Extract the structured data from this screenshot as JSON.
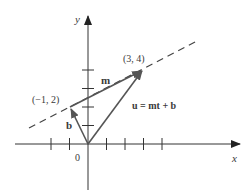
{
  "diagram": {
    "axes": {
      "x_label": "x",
      "y_label": "y",
      "origin_label": "0",
      "x_ticks": [
        -2,
        -1,
        1,
        2,
        3,
        4
      ],
      "y_ticks": [
        1,
        2,
        3,
        4
      ]
    },
    "points": {
      "p1": {
        "label": "(−1, 2)",
        "x": -1,
        "y": 2
      },
      "p2": {
        "label": "(3, 4)",
        "x": 3,
        "y": 4
      }
    },
    "vectors": {
      "b": {
        "label": "b",
        "from": [
          0,
          0
        ],
        "to": [
          -1,
          2
        ]
      },
      "m": {
        "label": "m",
        "from": [
          -1,
          2
        ],
        "to": [
          3,
          4
        ]
      },
      "u": {
        "label": "u = mt + b",
        "from": [
          0,
          0
        ],
        "to": [
          3,
          4
        ]
      }
    },
    "line": {
      "style": "dashed",
      "through": [
        [
          -1,
          2
        ],
        [
          3,
          4
        ]
      ]
    },
    "colors": {
      "vector": "#555555",
      "axis": "#333333",
      "text": "#3a3a3a"
    }
  }
}
